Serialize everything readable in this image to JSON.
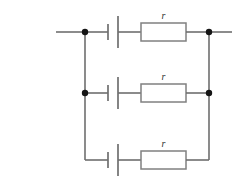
{
  "diagram": {
    "type": "circuit-schematic",
    "colors": {
      "wire": "#6f6f6f",
      "resistor_outline": "#808080",
      "node_dot": "#151515",
      "label_text": "#303030",
      "background": "#ffffff"
    },
    "branches": [
      {
        "id": "top",
        "cell_label": "",
        "resistor_label": "r",
        "left_node": "dot",
        "right_node": "dot",
        "has_left_lead": true,
        "has_right_lead": true
      },
      {
        "id": "middle",
        "cell_label": "",
        "resistor_label": "r",
        "left_node": "dot",
        "right_node": "dot",
        "has_left_lead": false,
        "has_right_lead": false
      },
      {
        "id": "bottom",
        "cell_label": "",
        "resistor_label": "r",
        "left_node": "corner",
        "right_node": "corner",
        "has_left_lead": false,
        "has_right_lead": false
      }
    ],
    "labels": {
      "top_resistor": "r",
      "middle_resistor": "r",
      "bottom_resistor": "r"
    }
  }
}
